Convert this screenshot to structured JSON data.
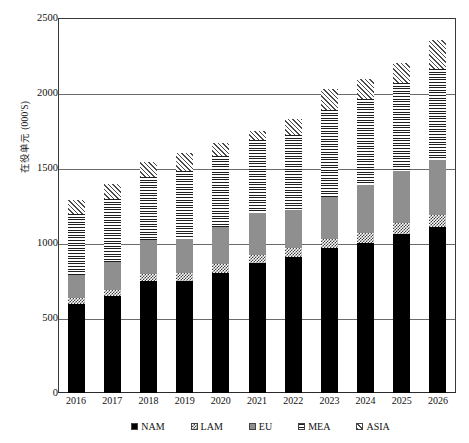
{
  "chart_data": {
    "type": "bar",
    "subtype": "stacked-bar",
    "title": "",
    "xlabel": "",
    "ylabel": "在役单元 (000'S)",
    "ylim": [
      0,
      2500
    ],
    "ytick_values": [
      0,
      500,
      1000,
      1500,
      2000,
      2500
    ],
    "ytick_labels": [
      "0",
      "500",
      "1000",
      "1500",
      "2000",
      "2500"
    ],
    "grid": true,
    "grid_axis": "y",
    "legend_position": "bottom",
    "categories": [
      "2016",
      "2017",
      "2018",
      "2019",
      "2020",
      "2021",
      "2022",
      "2023",
      "2024",
      "2025",
      "2026"
    ],
    "series": [
      {
        "name": "NAM",
        "pattern": "solid-black",
        "color": "#000000",
        "values": [
          595,
          645,
          745,
          745,
          800,
          865,
          905,
          965,
          1000,
          1060,
          1110
        ]
      },
      {
        "name": "LAM",
        "pattern": "checkerboard",
        "color": "#3d3d3d",
        "values": [
          40,
          45,
          50,
          55,
          60,
          55,
          65,
          60,
          70,
          75,
          80
        ]
      },
      {
        "name": "EU",
        "pattern": "solid-gray",
        "color": "#8f8f8f",
        "values": [
          155,
          185,
          225,
          230,
          250,
          280,
          250,
          280,
          320,
          345,
          365
        ]
      },
      {
        "name": "MEA",
        "pattern": "horizontal-lines",
        "color": "#1f1f1f",
        "values": [
          405,
          420,
          420,
          450,
          470,
          490,
          500,
          585,
          570,
          585,
          605
        ]
      },
      {
        "name": "ASIA",
        "pattern": "diagonal-lines",
        "color": "#4a4a4a",
        "values": [
          95,
          100,
          100,
          120,
          90,
          55,
          105,
          140,
          135,
          135,
          195
        ]
      }
    ],
    "totals": [
      1290,
      1395,
      1540,
      1600,
      1670,
      1745,
      1825,
      2030,
      2095,
      2200,
      2355
    ]
  },
  "legend": {
    "items": [
      {
        "label": "NAM",
        "swatch": "solid-black-swatch"
      },
      {
        "label": "LAM",
        "swatch": "checkerboard-swatch"
      },
      {
        "label": "EU",
        "swatch": "solid-gray-swatch"
      },
      {
        "label": "MEA",
        "swatch": "horizontal-lines-swatch"
      },
      {
        "label": "ASIA",
        "swatch": "diagonal-lines-swatch"
      }
    ]
  }
}
